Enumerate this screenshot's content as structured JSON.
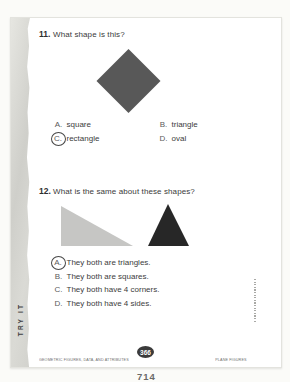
{
  "document": {
    "side_label": "TRY IT",
    "footer": {
      "left": "GEOMETRIC FIGURES, DATA, AND ATTRIBUTES",
      "page_number": "366",
      "right": "PLANE FIGURES"
    },
    "below_page_number": "714"
  },
  "questions": [
    {
      "number": "11.",
      "text": "What shape is this?",
      "figure": "dark-gray diamond (rotated square)",
      "options": [
        {
          "letter": "A.",
          "label": "square",
          "selected": false
        },
        {
          "letter": "B.",
          "label": "triangle",
          "selected": false
        },
        {
          "letter": "C.",
          "label": "rectangle",
          "selected": true
        },
        {
          "letter": "D.",
          "label": "oval",
          "selected": false
        }
      ]
    },
    {
      "number": "12.",
      "text": "What is the same about these shapes?",
      "figure": "light-gray right triangle and black triangle",
      "options": [
        {
          "letter": "A.",
          "label": "They both are triangles.",
          "selected": true
        },
        {
          "letter": "B.",
          "label": "They both are squares.",
          "selected": false
        },
        {
          "letter": "C.",
          "label": "They both have 4 corners.",
          "selected": false
        },
        {
          "letter": "D.",
          "label": "They both have 4 sides.",
          "selected": false
        }
      ]
    }
  ],
  "colors": {
    "diamond": "#585858",
    "triangle_light": "#c6c6c4",
    "triangle_dark": "#272727",
    "badge_bg": "#3b3b3b",
    "badge_text": "#ffffff"
  }
}
